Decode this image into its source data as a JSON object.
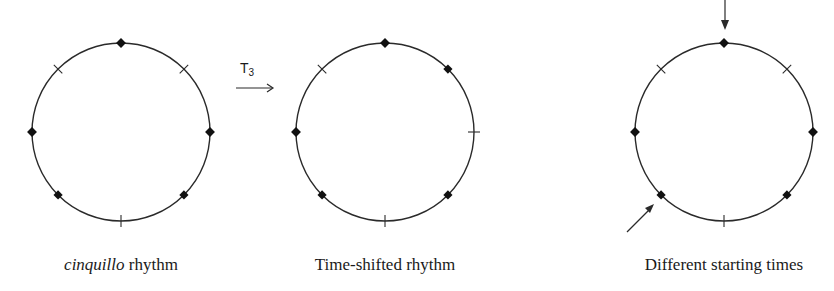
{
  "figures": [
    {
      "id": "cinquillo",
      "caption_italic": "cinquillo",
      "caption_rest": " rhythm",
      "center": [
        121,
        132
      ],
      "radius": 89,
      "pulses": 8,
      "onsets": [
        0,
        2,
        3,
        5,
        6
      ]
    },
    {
      "id": "time-shifted",
      "caption": "Time-shifted rhythm",
      "center": [
        385,
        132
      ],
      "radius": 89,
      "pulses": 8,
      "onsets": [
        0,
        1,
        3,
        5,
        6
      ]
    },
    {
      "id": "different-starting-times",
      "caption": "Different starting times",
      "center": [
        724,
        132
      ],
      "radius": 89,
      "pulses": 8,
      "onsets": [
        0,
        2,
        3,
        5,
        6
      ],
      "start_arrows": [
        "top",
        "lower-left"
      ]
    }
  ],
  "transform_label": {
    "letter": "T",
    "subscript": "3"
  },
  "colors": {
    "stroke": "#2a2a2a",
    "marker": "#111111",
    "background": "#ffffff"
  }
}
